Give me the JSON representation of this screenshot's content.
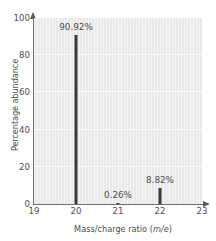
{
  "chart_data": {
    "type": "bar",
    "title": "",
    "xlabel": "Mass/charge ratio (m/e)",
    "xlabel_prefix": "Mass/charge ratio (",
    "xlabel_unit": "m/e",
    "xlabel_suffix": ")",
    "ylabel": "Percentage abundance",
    "categories": [
      20,
      21,
      22
    ],
    "x": [
      20,
      21,
      22
    ],
    "values": [
      90.92,
      0.26,
      8.82
    ],
    "data_labels": [
      "90.92%",
      "0.26%",
      "8.82%"
    ],
    "xlim": [
      19,
      23
    ],
    "ylim": [
      0,
      100
    ],
    "xticks": [
      19,
      20,
      21,
      22,
      23
    ],
    "xtick_labels": [
      "19",
      "20",
      "21",
      "22",
      "23"
    ],
    "yticks": [
      0,
      20,
      40,
      60,
      80,
      100
    ],
    "ytick_labels": [
      "0",
      "20",
      "40",
      "60",
      "80",
      "100"
    ],
    "grid": "horizontal",
    "legend": "none",
    "bar_color": "#3a3a3a",
    "plot_background": "#e9e9e9",
    "gridline_color": "#fbfbfb",
    "axis_color": "#6e6e70",
    "text_color": "#4d4d4f"
  }
}
